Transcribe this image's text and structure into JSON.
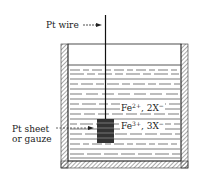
{
  "labels": {
    "wire": "Pt wire",
    "sheet_line1": "Pt sheet",
    "sheet_line2": "or gauze",
    "ion1_base": "Fe",
    "ion1_charge": "2+",
    "ion1_counter": ", 2X",
    "ion1_counter_charge": "−",
    "ion2_base": "Fe",
    "ion2_charge": "3+",
    "ion2_counter": ", 3X",
    "ion2_counter_charge": "−"
  },
  "colors": {
    "line": "#222222",
    "background": "#ffffff"
  }
}
